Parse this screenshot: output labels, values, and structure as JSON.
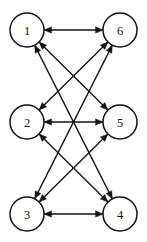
{
  "figure": {
    "name": "directed-graph",
    "background_color": "#ffffff",
    "stroke_color": "#131313",
    "label_color": "#111111",
    "width": 147,
    "height": 242
  },
  "graph": {
    "node_radius": 17,
    "arrow_length": 7.5,
    "arrow_half_width": 3.2,
    "nodes": [
      {
        "id": "1",
        "label": "1",
        "cx": 27,
        "cy": 30
      },
      {
        "id": "6",
        "label": "6",
        "cx": 120,
        "cy": 30
      },
      {
        "id": "2",
        "label": "2",
        "cx": 27,
        "cy": 122
      },
      {
        "id": "5",
        "label": "5",
        "cx": 120,
        "cy": 122
      },
      {
        "id": "3",
        "label": "3",
        "cx": 27,
        "cy": 214
      },
      {
        "id": "4",
        "label": "4",
        "cx": 120,
        "cy": 214
      }
    ],
    "edges": [
      {
        "from": "1",
        "to": "6",
        "type": "bidirectional"
      },
      {
        "from": "2",
        "to": "5",
        "type": "bidirectional"
      },
      {
        "from": "3",
        "to": "4",
        "type": "bidirectional"
      },
      {
        "from": "1",
        "to": "5",
        "type": "bidirectional"
      },
      {
        "from": "2",
        "to": "6",
        "type": "bidirectional"
      },
      {
        "from": "2",
        "to": "4",
        "type": "bidirectional"
      },
      {
        "from": "3",
        "to": "5",
        "type": "bidirectional"
      },
      {
        "from": "1",
        "to": "4",
        "type": "bidirectional"
      },
      {
        "from": "3",
        "to": "6",
        "type": "bidirectional"
      }
    ]
  }
}
